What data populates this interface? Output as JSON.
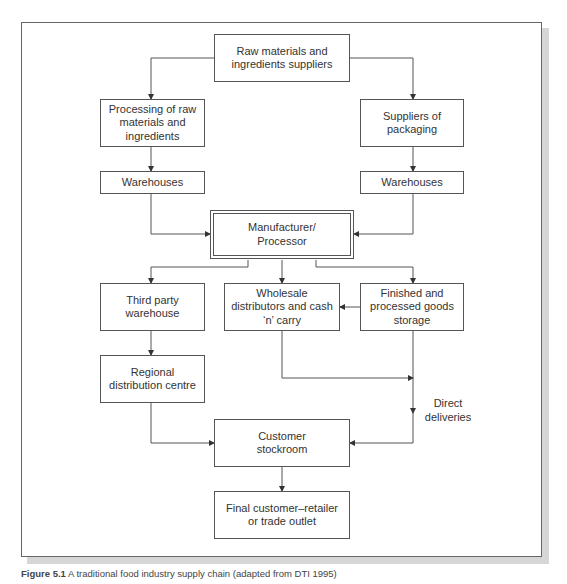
{
  "diagram": {
    "nodes": {
      "raw_materials": "Raw materials and ingredients suppliers",
      "processing": "Processing of raw materials and ingredients",
      "packaging": "Suppliers of packaging",
      "warehouses_left": "Warehouses",
      "warehouses_right": "Warehouses",
      "manufacturer": "Manufacturer/ Processor",
      "third_party": "Third party warehouse",
      "wholesale": "Wholesale distributors and cash ‘n’ carry",
      "finished_goods": "Finished and processed goods storage",
      "regional": "Regional distribution centre",
      "customer_stockroom": "Customer stockroom",
      "final_customer": "Final customer–retailer or trade outlet"
    },
    "edge_labels": {
      "direct_deliveries": "Direct deliveries"
    },
    "edges": [
      [
        "raw_materials",
        "processing"
      ],
      [
        "raw_materials",
        "packaging"
      ],
      [
        "processing",
        "warehouses_left"
      ],
      [
        "packaging",
        "warehouses_right"
      ],
      [
        "warehouses_left",
        "manufacturer"
      ],
      [
        "warehouses_right",
        "manufacturer"
      ],
      [
        "manufacturer",
        "third_party"
      ],
      [
        "manufacturer",
        "wholesale"
      ],
      [
        "manufacturer",
        "finished_goods"
      ],
      [
        "finished_goods",
        "wholesale"
      ],
      [
        "third_party",
        "regional"
      ],
      [
        "wholesale",
        "direct_deliveries"
      ],
      [
        "finished_goods",
        "customer_stockroom"
      ],
      [
        "regional",
        "customer_stockroom"
      ],
      [
        "customer_stockroom",
        "final_customer"
      ]
    ]
  },
  "caption": {
    "label": "Figure 5.1",
    "text": " A traditional food industry supply chain (adapted from DTI 1995)"
  }
}
